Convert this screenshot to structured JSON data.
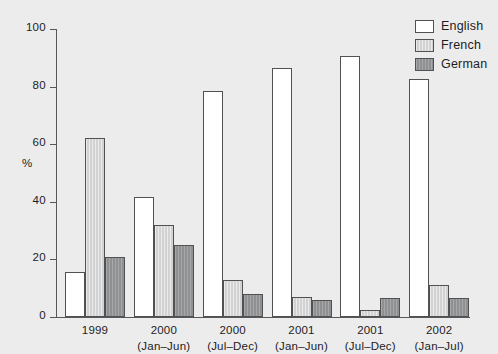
{
  "chart_data": {
    "type": "bar",
    "title": "",
    "xlabel": "",
    "ylabel": "%",
    "ylim": [
      0,
      100
    ],
    "yticks": [
      0,
      20,
      40,
      60,
      80,
      100
    ],
    "grid": false,
    "legend_position": "top-right",
    "categories": [
      {
        "line1": "1999",
        "line2": ""
      },
      {
        "line1": "2000",
        "line2": "(Jan–Jun)"
      },
      {
        "line1": "2000",
        "line2": "(Jul–Dec)"
      },
      {
        "line1": "2001",
        "line2": "(Jan–Jun)"
      },
      {
        "line1": "2001",
        "line2": "(Jul–Dec)"
      },
      {
        "line1": "2002",
        "line2": "(Jan–Jul)"
      }
    ],
    "series": [
      {
        "name": "English",
        "color": "#ffffff",
        "values": [
          15.5,
          41.5,
          78.5,
          86.5,
          90.5,
          82.5
        ]
      },
      {
        "name": "French",
        "color": "#d2d2d2",
        "values": [
          62.0,
          32.0,
          13.0,
          7.0,
          2.5,
          11.0
        ]
      },
      {
        "name": "German",
        "color": "#8e9092",
        "values": [
          21.0,
          25.0,
          8.0,
          6.0,
          6.5,
          6.5
        ]
      }
    ]
  },
  "legend": {
    "items": [
      {
        "label": "English",
        "swatch": "english"
      },
      {
        "label": "French",
        "swatch": "french"
      },
      {
        "label": "German",
        "swatch": "german"
      }
    ]
  },
  "colors": {
    "background": "#ececed",
    "axis": "#555759",
    "bar_outline": "#4f5153",
    "english": "#ffffff",
    "french": "#d2d2d2",
    "german": "#8e9092",
    "text": "#1d1d1d"
  }
}
